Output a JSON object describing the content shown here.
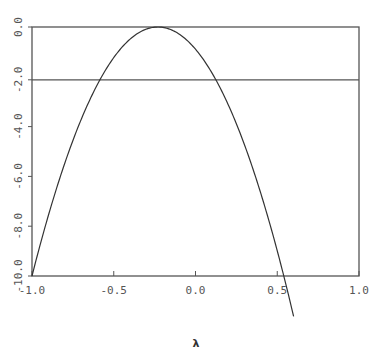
{
  "chart_data": {
    "type": "line",
    "title": "",
    "xlabel": "λ",
    "ylabel": "",
    "xlim": [
      -1.0,
      1.0
    ],
    "ylim": [
      -10.0,
      0.0
    ],
    "grid": false,
    "legend": null,
    "x_ticks": [
      "-1.0",
      "-0.5",
      "0.0",
      "0.5",
      "1.0"
    ],
    "x_tick_values": [
      -1.0,
      -0.5,
      0.0,
      0.5,
      1.0
    ],
    "y_ticks": [
      "0.0",
      "-2.0",
      "-4.0",
      "-6.0",
      "-8.0",
      "-10.0"
    ],
    "y_tick_values": [
      0.0,
      -2.0,
      -4.0,
      -6.0,
      -8.0,
      -10.0
    ],
    "reference_lines": [
      {
        "orientation": "horizontal",
        "y": -2.0
      }
    ],
    "series": [
      {
        "name": "curve",
        "shape": "downward parabola",
        "vertex": [
          -0.23,
          0.0
        ],
        "x": [
          -1.0,
          -0.9,
          -0.8,
          -0.7,
          -0.6,
          -0.55,
          -0.5,
          -0.4,
          -0.3,
          -0.23,
          -0.1,
          0.0,
          0.1,
          0.2,
          0.3,
          0.4,
          0.5,
          0.55,
          0.6
        ],
        "y": [
          -10.0,
          -7.6,
          -5.5,
          -3.7,
          -2.3,
          -1.7,
          -1.2,
          -0.5,
          -0.1,
          0.0,
          -0.3,
          -0.9,
          -1.8,
          -3.1,
          -4.7,
          -6.7,
          -9.0,
          -10.3,
          -11.6
        ]
      }
    ]
  }
}
